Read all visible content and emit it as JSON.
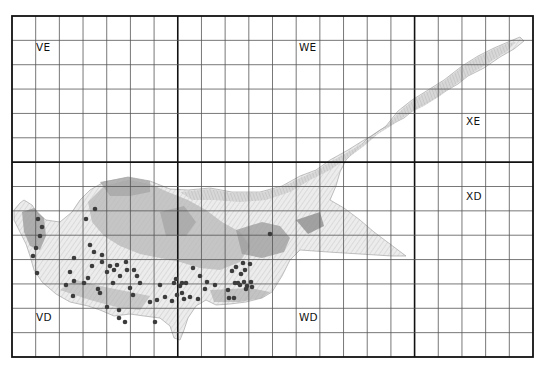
{
  "map": {
    "type": "grid distribution map",
    "grid": {
      "left": 12,
      "top": 16,
      "right": 533,
      "bottom": 357,
      "columns": 22,
      "rows": 14,
      "major_columns": [
        7,
        17
      ],
      "major_rows": [
        6
      ],
      "line_color": "#555555",
      "major_line_color": "#111111"
    },
    "square_labels": [
      {
        "text": "VE",
        "x": 36,
        "y": 47
      },
      {
        "text": "WE",
        "x": 299,
        "y": 47
      },
      {
        "text": "XE",
        "x": 466,
        "y": 121
      },
      {
        "text": "XD",
        "x": 466,
        "y": 196
      },
      {
        "text": "VD",
        "x": 36,
        "y": 317
      },
      {
        "text": "WD",
        "x": 299,
        "y": 317
      }
    ],
    "colors": {
      "land_light": "#e4e4e4",
      "land_mid": "#c6c6c6",
      "land_dark": "#a9a9a9",
      "dot": "#3c3c3c"
    },
    "records": [
      [
        95,
        209
      ],
      [
        86,
        219
      ],
      [
        38,
        219
      ],
      [
        42,
        227
      ],
      [
        40,
        236
      ],
      [
        36,
        248
      ],
      [
        33,
        256
      ],
      [
        37,
        273
      ],
      [
        90,
        245
      ],
      [
        94,
        252
      ],
      [
        92,
        266
      ],
      [
        88,
        278
      ],
      [
        84,
        283
      ],
      [
        74,
        281
      ],
      [
        70,
        272
      ],
      [
        74,
        258
      ],
      [
        102,
        255
      ],
      [
        102,
        262
      ],
      [
        110,
        266
      ],
      [
        117,
        265
      ],
      [
        114,
        270
      ],
      [
        107,
        272
      ],
      [
        126,
        262
      ],
      [
        127,
        270
      ],
      [
        120,
        276
      ],
      [
        113,
        283
      ],
      [
        98,
        289
      ],
      [
        100,
        293
      ],
      [
        66,
        285
      ],
      [
        73,
        296
      ],
      [
        134,
        270
      ],
      [
        137,
        276
      ],
      [
        130,
        288
      ],
      [
        140,
        283
      ],
      [
        133,
        295
      ],
      [
        150,
        302
      ],
      [
        157,
        300
      ],
      [
        165,
        297
      ],
      [
        172,
        301
      ],
      [
        177,
        295
      ],
      [
        180,
        286
      ],
      [
        174,
        283
      ],
      [
        176,
        279
      ],
      [
        182,
        283
      ],
      [
        186,
        283
      ],
      [
        182,
        293
      ],
      [
        184,
        299
      ],
      [
        190,
        297
      ],
      [
        198,
        299
      ],
      [
        205,
        289
      ],
      [
        207,
        282
      ],
      [
        200,
        276
      ],
      [
        193,
        268
      ],
      [
        232,
        271
      ],
      [
        236,
        267
      ],
      [
        241,
        274
      ],
      [
        244,
        282
      ],
      [
        240,
        285
      ],
      [
        247,
        286
      ],
      [
        252,
        287
      ],
      [
        245,
        270
      ],
      [
        250,
        264
      ],
      [
        243,
        263
      ],
      [
        238,
        283
      ],
      [
        228,
        290
      ],
      [
        229,
        298
      ],
      [
        234,
        298
      ],
      [
        119,
        310
      ],
      [
        119,
        318
      ],
      [
        125,
        322
      ],
      [
        107,
        307
      ],
      [
        155,
        322
      ],
      [
        270,
        234
      ],
      [
        235,
        283
      ],
      [
        246,
        289
      ],
      [
        251,
        282
      ],
      [
        215,
        285
      ],
      [
        160,
        285
      ]
    ]
  }
}
